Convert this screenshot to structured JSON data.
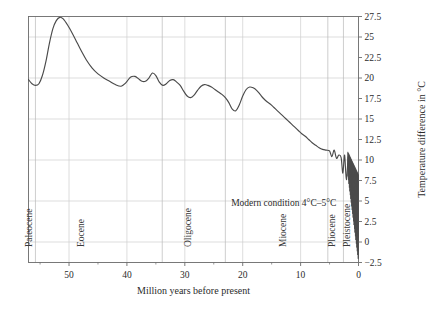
{
  "chart_data": {
    "type": "line",
    "title": "",
    "xlabel": "Million years before present",
    "ylabel": "Temperature difference in °C",
    "xlim": [
      57,
      0
    ],
    "ylim": [
      -2.5,
      27.5
    ],
    "x_ticks": [
      50,
      40,
      30,
      20,
      10,
      0
    ],
    "x_tick_labels": [
      "50",
      "40",
      "30",
      "20",
      "10",
      "0"
    ],
    "x_minor_ticks": [
      55,
      45,
      35,
      25,
      15,
      5
    ],
    "y_ticks": [
      -2.5,
      0,
      2.5,
      5,
      7.5,
      10,
      12.5,
      15,
      17.5,
      20,
      22.5,
      25,
      27.5
    ],
    "y_tick_labels": [
      "−2.5",
      "0",
      "2.5",
      "5",
      "7.5",
      "10",
      "12.5",
      "15",
      "17.5",
      "20",
      "22.5",
      "25",
      "27.5"
    ],
    "gridlines": {
      "x_major": [
        50,
        40,
        30,
        20,
        10,
        0
      ],
      "y_major": [
        0,
        5,
        10,
        15,
        20,
        25
      ],
      "visible": true
    },
    "legend": {
      "visible": false,
      "position": "none"
    },
    "series": [
      {
        "name": "Global temperature difference",
        "color": "#4a4a4a",
        "x": [
          57.0,
          56.4,
          55.8,
          55.2,
          54.6,
          54.0,
          53.4,
          52.8,
          52.2,
          51.6,
          51.0,
          50.2,
          49.4,
          48.6,
          47.8,
          47.0,
          46.0,
          45.0,
          44.0,
          43.0,
          42.0,
          41.0,
          40.2,
          39.4,
          38.6,
          38.0,
          37.4,
          36.8,
          36.2,
          35.6,
          35.0,
          34.4,
          33.8,
          33.2,
          32.6,
          32.0,
          31.4,
          30.8,
          30.2,
          29.6,
          29.0,
          28.4,
          27.8,
          27.2,
          26.6,
          26.0,
          25.4,
          24.8,
          24.2,
          23.6,
          23.0,
          22.4,
          21.8,
          21.2,
          20.6,
          20.0,
          19.4,
          18.8,
          18.2,
          17.6,
          17.0,
          16.4,
          15.8,
          15.2,
          14.6,
          14.0,
          13.4,
          12.8,
          12.2,
          11.6,
          11.0,
          10.4,
          9.8,
          9.2,
          8.6,
          8.0,
          7.4,
          6.8,
          6.2,
          5.6,
          5.0,
          4.6,
          4.2,
          3.8,
          3.4,
          3.0,
          2.7,
          2.4,
          2.1,
          1.8
        ],
        "y": [
          19.8,
          19.3,
          19.1,
          19.3,
          20.3,
          22.0,
          24.2,
          26.0,
          27.0,
          27.4,
          27.2,
          26.4,
          25.4,
          24.3,
          23.2,
          22.2,
          21.2,
          20.5,
          20.0,
          19.6,
          19.2,
          19.0,
          19.4,
          20.1,
          20.2,
          19.9,
          19.6,
          19.6,
          20.0,
          20.6,
          20.3,
          19.5,
          19.1,
          19.3,
          19.7,
          19.8,
          19.5,
          19.1,
          18.4,
          17.8,
          17.6,
          17.9,
          18.5,
          19.0,
          19.2,
          19.1,
          18.9,
          18.6,
          18.3,
          18.0,
          17.6,
          17.0,
          16.2,
          16.0,
          16.7,
          17.8,
          18.6,
          18.9,
          18.8,
          18.5,
          18.0,
          17.5,
          17.1,
          16.8,
          16.4,
          16.0,
          15.6,
          15.2,
          14.8,
          14.4,
          14.0,
          13.6,
          13.2,
          12.9,
          12.5,
          12.1,
          11.8,
          11.5,
          11.3,
          11.2,
          11.1,
          10.4,
          11.2,
          10.2,
          10.6,
          10.3,
          8.4,
          10.6,
          7.6,
          10.4
        ]
      },
      {
        "name": "Pleistocene glacial-interglacial oscillations",
        "color": "#4a4a4a",
        "note": "high-frequency sawtooth, ~1.8 Ma to present, amplitude widening from 10°C down to -2.5°C",
        "oscillation": {
          "x_start": 1.85,
          "x_end": 0.0,
          "cycles": 23,
          "top_start": 11.0,
          "top_end": 8.2,
          "bottom_start": 8.0,
          "bottom_end": -2.5
        }
      }
    ],
    "epochs": [
      {
        "name": "Paleocene",
        "x_start": 57.0,
        "x_end": 55.8,
        "label_x": 56.4
      },
      {
        "name": "Eocene",
        "x_start": 55.8,
        "x_end": 33.9,
        "label_x": 47.5
      },
      {
        "name": "Oligocene",
        "x_start": 33.9,
        "x_end": 23.0,
        "label_x": 29.0
      },
      {
        "name": "Miocene",
        "x_start": 23.0,
        "x_end": 5.3,
        "label_x": 12.5
      },
      {
        "name": "Pliocene",
        "x_start": 5.3,
        "x_end": 2.6,
        "label_x": 4.1
      },
      {
        "name": "Pleistocene",
        "x_start": 2.6,
        "x_end": 0.0,
        "label_x": 1.5
      }
    ],
    "epoch_dividers": [
      55.8,
      33.9,
      23.0,
      5.3,
      2.6
    ],
    "annotations": [
      {
        "text": "Modern condition 4°C–5°C",
        "x": 22.0,
        "y": 4.8,
        "anchor": "start"
      }
    ]
  },
  "axes": {
    "x_axis_title": "Million years before present",
    "y_axis_title": "Temperature difference in °C"
  },
  "colors": {
    "line": "#4a4a4a",
    "grid": "#cfcfcf",
    "axis": "#6b6b6b",
    "text": "#1f1f1f",
    "background": "#ffffff"
  }
}
